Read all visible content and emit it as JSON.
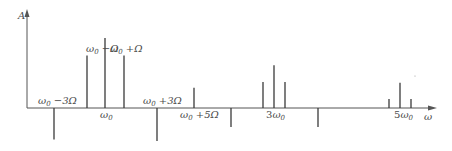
{
  "diagram": {
    "y_axis_label": "A",
    "x_axis_label": "ω",
    "colors": {
      "line": "#3a3a3a",
      "axis": "#555555",
      "text": "#4a4a4a"
    },
    "chart_data": {
      "type": "bar",
      "title": "",
      "xlabel": "ω",
      "ylabel": "A",
      "note": "Spectral lines (stems) in arbitrary units; positive values point up, negative down",
      "lines": [
        {
          "name": "w0-3W",
          "label": "ω0 −3Ω",
          "x": "ω0-3Ω",
          "value": -0.45
        },
        {
          "name": "w0-W",
          "label": "ω0 −Ω",
          "x": "ω0-Ω",
          "value": 0.75
        },
        {
          "name": "w0",
          "label": "ω0",
          "x": "ω0",
          "value": 1.0
        },
        {
          "name": "w0+W",
          "label": "ω0 +Ω",
          "x": "ω0+Ω",
          "value": 0.75
        },
        {
          "name": "w0+3W",
          "label": "ω0 +3Ω",
          "x": "ω0+3Ω",
          "value": -0.47
        },
        {
          "name": "w0+5W",
          "label": "ω0 +5Ω",
          "x": "ω0+5Ω",
          "value": 0.29
        },
        {
          "name": "neg-a",
          "label": "",
          "x": "between ω0+5Ω and 3ω0",
          "value": -0.27
        },
        {
          "name": "3w0-W",
          "label": "",
          "x": "3ω0-Ω",
          "value": 0.37
        },
        {
          "name": "3w0",
          "label": "3ω0",
          "x": "3ω0",
          "value": 0.61
        },
        {
          "name": "3w0+W",
          "label": "",
          "x": "3ω0+Ω",
          "value": 0.37
        },
        {
          "name": "neg-b",
          "label": "",
          "x": "between 3ω0 and 5ω0",
          "value": -0.27
        },
        {
          "name": "5w0-W",
          "label": "",
          "x": "5ω0-Ω",
          "value": 0.13
        },
        {
          "name": "5w0",
          "label": "5ω0",
          "x": "5ω0",
          "value": 0.36
        },
        {
          "name": "5w0+W",
          "label": "",
          "x": "5ω0+Ω",
          "value": 0.13
        }
      ]
    },
    "labels": {
      "w0_minus_3W": {
        "base": "ω",
        "sub": "0",
        "rest": " −3Ω"
      },
      "w0_minus_W": {
        "base": "ω",
        "sub": "0",
        "rest": " −Ω"
      },
      "w0_plus_W": {
        "base": "ω",
        "sub": "0",
        "rest": " +Ω"
      },
      "w0": {
        "base": "ω",
        "sub": "0",
        "rest": ""
      },
      "w0_plus_3W": {
        "base": "ω",
        "sub": "0",
        "rest": " +3Ω"
      },
      "w0_plus_5W": {
        "base": "ω",
        "sub": "0",
        "rest": " +5Ω"
      },
      "three_w0": {
        "pre": "3",
        "base": "ω",
        "sub": "0"
      },
      "five_w0": {
        "pre": "5",
        "base": "ω",
        "sub": "0"
      }
    }
  }
}
